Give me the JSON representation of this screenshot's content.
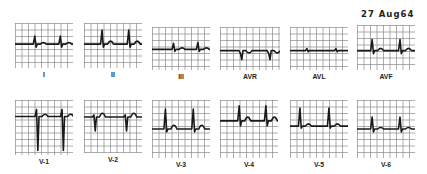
{
  "date_label": "27 Aug64",
  "grid_color": "#8a8a8a",
  "trace_color": "#1a1a1a",
  "leads": [
    {
      "label": "I",
      "x": 15,
      "y": 23,
      "w": 58,
      "h": 45,
      "base": 0.47,
      "beats": [
        {
          "x": 0.35,
          "r": -8,
          "s": 3
        },
        {
          "x": 0.79,
          "r": -8,
          "s": 3
        }
      ],
      "t": 2
    },
    {
      "label": "II",
      "x": 84,
      "y": 23,
      "w": 58,
      "h": 45,
      "base": 0.47,
      "beats": [
        {
          "x": 0.32,
          "r": -14,
          "s": 3
        },
        {
          "x": 0.78,
          "r": -14,
          "s": 3
        }
      ],
      "t": 4
    },
    {
      "label": "III",
      "x": 152,
      "y": 27,
      "w": 58,
      "h": 43,
      "base": 0.52,
      "beats": [
        {
          "x": 0.38,
          "r": -6,
          "s": 2
        },
        {
          "x": 0.8,
          "r": -7,
          "s": 2
        }
      ],
      "t": 2
    },
    {
      "label": "AVR",
      "x": 220,
      "y": 27,
      "w": 60,
      "h": 43,
      "base": 0.55,
      "beats": [
        {
          "x": 0.35,
          "r": 3,
          "s": 9
        },
        {
          "x": 0.82,
          "r": 3,
          "s": 9
        }
      ],
      "t": -3
    },
    {
      "label": "AVL",
      "x": 290,
      "y": 27,
      "w": 58,
      "h": 43,
      "base": 0.55,
      "beats": [
        {
          "x": 0.3,
          "r": -2,
          "s": 1
        },
        {
          "x": 0.8,
          "r": -2,
          "s": 1
        }
      ],
      "t": 0
    },
    {
      "label": "AVF",
      "x": 357,
      "y": 25,
      "w": 58,
      "h": 45,
      "base": 0.57,
      "beats": [
        {
          "x": 0.27,
          "r": -11,
          "s": 3
        },
        {
          "x": 0.75,
          "r": -11,
          "s": 3
        }
      ],
      "t": 3
    },
    {
      "label": "V-1",
      "x": 15,
      "y": 100,
      "w": 58,
      "h": 55,
      "base": 0.3,
      "beats": [
        {
          "x": 0.38,
          "r": -7,
          "s": 34
        },
        {
          "x": 0.82,
          "r": -7,
          "s": 34
        }
      ],
      "t": 3
    },
    {
      "label": "V-2",
      "x": 84,
      "y": 100,
      "w": 58,
      "h": 53,
      "base": 0.32,
      "beats": [
        {
          "x": 0.18,
          "r": -2,
          "s": 14
        },
        {
          "x": 0.72,
          "r": -2,
          "s": 14
        }
      ],
      "t": 5
    },
    {
      "label": "V-3",
      "x": 152,
      "y": 100,
      "w": 58,
      "h": 58,
      "base": 0.5,
      "beats": [
        {
          "x": 0.24,
          "r": -20,
          "s": 3
        },
        {
          "x": 0.72,
          "r": -20,
          "s": 3
        }
      ],
      "t": 5
    },
    {
      "label": "V-4",
      "x": 220,
      "y": 100,
      "w": 58,
      "h": 58,
      "base": 0.36,
      "beats": [
        {
          "x": 0.34,
          "r": -15,
          "s": 5
        },
        {
          "x": 0.8,
          "r": -15,
          "s": 5
        }
      ],
      "t": 5
    },
    {
      "label": "V-5",
      "x": 290,
      "y": 100,
      "w": 58,
      "h": 58,
      "base": 0.45,
      "beats": [
        {
          "x": 0.18,
          "r": -18,
          "s": 2
        },
        {
          "x": 0.68,
          "r": -18,
          "s": 2
        }
      ],
      "t": 3
    },
    {
      "label": "V-6",
      "x": 357,
      "y": 100,
      "w": 58,
      "h": 58,
      "base": 0.5,
      "beats": [
        {
          "x": 0.27,
          "r": -12,
          "s": 3
        },
        {
          "x": 0.75,
          "r": -12,
          "s": 3
        }
      ],
      "t": 2
    }
  ]
}
